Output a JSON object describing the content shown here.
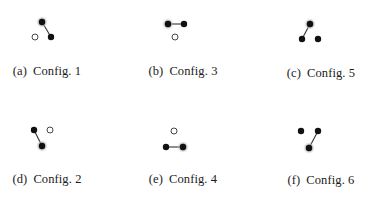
{
  "figure": {
    "panels": [
      {
        "id": "a",
        "tag": "(a)",
        "label": "Config. 1",
        "caption_pos": [
          47,
          64
        ],
        "nodes": [
          {
            "x": 42,
            "y": 22,
            "type": "filled",
            "halo": true
          },
          {
            "x": 51,
            "y": 37,
            "type": "filled",
            "halo": false
          },
          {
            "x": 35,
            "y": 37,
            "type": "open",
            "halo": false
          }
        ],
        "edges": [
          [
            0,
            1
          ]
        ]
      },
      {
        "id": "b",
        "tag": "(b)",
        "label": "Config. 3",
        "caption_pos": [
          183,
          64
        ],
        "nodes": [
          {
            "x": 168,
            "y": 24,
            "type": "filled",
            "halo": true
          },
          {
            "x": 184,
            "y": 24,
            "type": "filled",
            "halo": false
          },
          {
            "x": 175,
            "y": 37,
            "type": "open",
            "halo": false
          }
        ],
        "edges": [
          [
            0,
            1
          ]
        ]
      },
      {
        "id": "c",
        "tag": "(c)",
        "label": "Config. 5",
        "caption_pos": [
          321,
          66
        ],
        "nodes": [
          {
            "x": 310,
            "y": 24,
            "type": "filled",
            "halo": true
          },
          {
            "x": 302,
            "y": 39,
            "type": "filled",
            "halo": false
          },
          {
            "x": 318,
            "y": 39,
            "type": "filled",
            "halo": false
          }
        ],
        "edges": [
          [
            0,
            1
          ]
        ]
      },
      {
        "id": "d",
        "tag": "(d)",
        "label": "Config. 2",
        "caption_pos": [
          47,
          172
        ],
        "nodes": [
          {
            "x": 34,
            "y": 130,
            "type": "filled",
            "halo": false
          },
          {
            "x": 50,
            "y": 130,
            "type": "open",
            "halo": false
          },
          {
            "x": 42,
            "y": 146,
            "type": "filled",
            "halo": true
          }
        ],
        "edges": [
          [
            0,
            2
          ]
        ]
      },
      {
        "id": "e",
        "tag": "(e)",
        "label": "Config. 4",
        "caption_pos": [
          183,
          172
        ],
        "nodes": [
          {
            "x": 174,
            "y": 131,
            "type": "open",
            "halo": false
          },
          {
            "x": 166,
            "y": 147,
            "type": "filled",
            "halo": false
          },
          {
            "x": 183,
            "y": 147,
            "type": "filled",
            "halo": true
          }
        ],
        "edges": [
          [
            1,
            2
          ]
        ]
      },
      {
        "id": "f",
        "tag": "(f)",
        "label": "Config. 6",
        "caption_pos": [
          321,
          173
        ],
        "nodes": [
          {
            "x": 301,
            "y": 131,
            "type": "filled",
            "halo": false
          },
          {
            "x": 318,
            "y": 131,
            "type": "filled",
            "halo": false
          },
          {
            "x": 309,
            "y": 148,
            "type": "filled",
            "halo": true
          }
        ],
        "edges": [
          [
            1,
            2
          ]
        ]
      }
    ],
    "colors": {
      "node_fill": "#111111",
      "halo": "#b5b5b5",
      "open_stroke": "#333333",
      "edge": "#333333",
      "caption": "#1a1a1a"
    }
  }
}
